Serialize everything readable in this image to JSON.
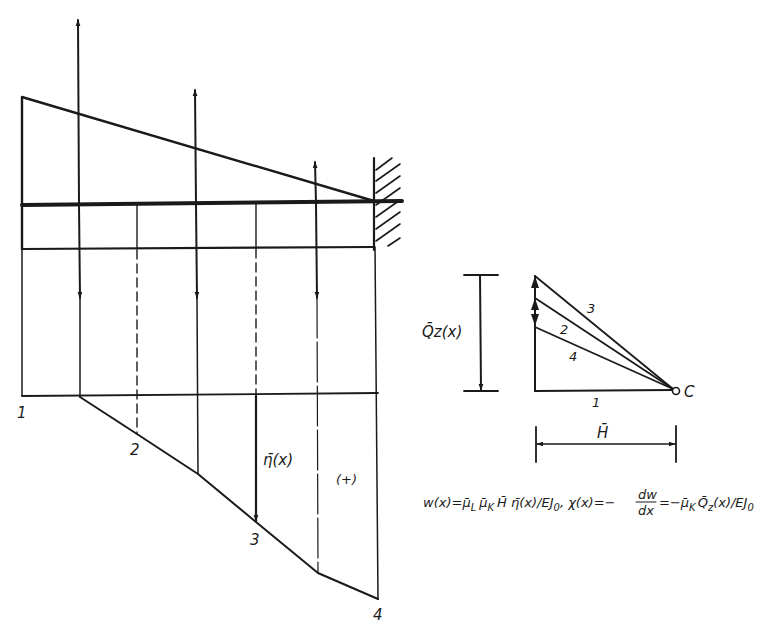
{
  "colors": {
    "ink": "#1a1a1a",
    "background": "#ffffff"
  },
  "beam_diagram": {
    "load_arrow_positions_x": [
      79,
      196,
      316
    ],
    "dashed_divisions_x": [
      137,
      256
    ],
    "support": "fixed-wall",
    "sign_label": "(+)",
    "ordinate_label": "η̄(x)",
    "funicular_point_labels": [
      "1",
      "2",
      "3",
      "4"
    ]
  },
  "force_polygon": {
    "qz_label": "Q̄z(x)",
    "pole_label": "C",
    "ray_labels": [
      "3",
      "2",
      "4",
      "1"
    ],
    "h_label": "H̄"
  },
  "formula": {
    "text": "w(x) = μ̄L μ̄K H̄ η̄(x)/EJ0 , χ(x) = −dw/dx = −μ̄K Q̄z(x)/EJ0",
    "part1": "w(x)=",
    "mu_L": "μ̄",
    "mu_L_sub": "L",
    "mu_K": "μ̄",
    "mu_K_sub": "K",
    "part2": "H̄ η̄(x)/EJ",
    "sub0": "0",
    "part3": ", χ(x)=−",
    "frac_num": "dw",
    "frac_den": "dx",
    "part4": "=−",
    "part5": "Q̄",
    "sub_z": "z",
    "part6": "(x)/EJ"
  }
}
